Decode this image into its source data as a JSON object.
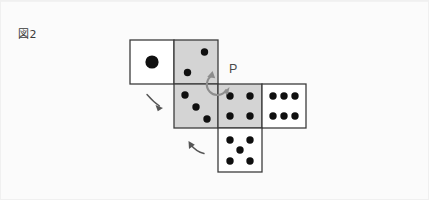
{
  "figure": {
    "label": "図2",
    "caption_number": "2",
    "background_color": "#fbfbfb",
    "border_color": "#f0f0f0"
  },
  "colors": {
    "face_shaded": "#d4d4d4",
    "face_plain": "#ffffff",
    "face_stroke": "#3c3c3c",
    "pip": "#101010",
    "guide_arrow": "#555555",
    "rotation_arrow": "#8d8d8d",
    "label_text": "#4a4a4a"
  },
  "net": {
    "description": "cube-net",
    "square_size": 44,
    "faces": [
      {
        "id": "face-one",
        "pips": 1,
        "shaded": false,
        "x": 129,
        "y": 39,
        "row": 1,
        "col": 1
      },
      {
        "id": "face-two",
        "pips": 2,
        "shaded": true,
        "x": 173,
        "y": 39,
        "row": 1,
        "col": 2
      },
      {
        "id": "face-three",
        "pips": 3,
        "shaded": true,
        "x": 173,
        "y": 83,
        "row": 2,
        "col": 2
      },
      {
        "id": "face-four",
        "pips": 4,
        "shaded": true,
        "x": 217,
        "y": 83,
        "row": 2,
        "col": 3
      },
      {
        "id": "face-six",
        "pips": 6,
        "shaded": false,
        "x": 261,
        "y": 83,
        "row": 2,
        "col": 4
      },
      {
        "id": "face-five",
        "pips": 5,
        "shaded": false,
        "x": 217,
        "y": 127,
        "row": 3,
        "col": 3
      }
    ]
  },
  "annotations": {
    "point_p": {
      "label": "P",
      "x": 217,
      "y": 83,
      "label_x": 228,
      "label_y": 71
    },
    "rotation_arrow": {
      "center_x": 217,
      "center_y": 83,
      "radius": 10,
      "direction": "counter-clockwise"
    },
    "guide_arrows": [
      {
        "id": "guide-arrow-left",
        "x": 152,
        "y": 98,
        "direction": "down-right"
      },
      {
        "id": "guide-arrow-bottom",
        "x": 190,
        "y": 148,
        "direction": "up-left"
      }
    ]
  }
}
